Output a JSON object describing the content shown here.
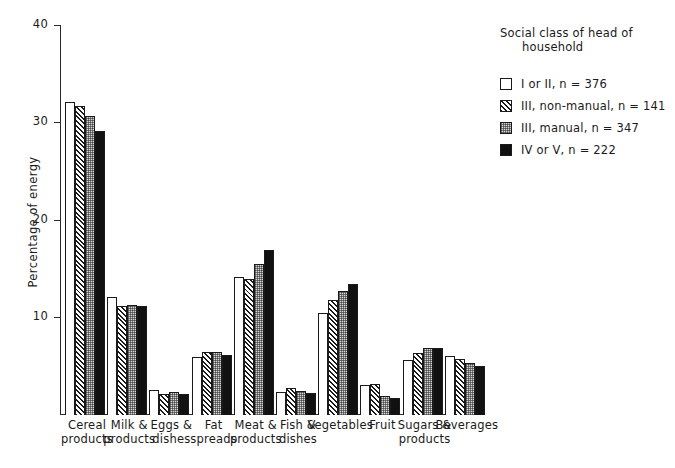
{
  "chart_data": {
    "type": "bar",
    "title": "",
    "xlabel": "",
    "ylabel": "Percentage of energy",
    "ylim": [
      0,
      40
    ],
    "yticks": [
      0,
      10,
      20,
      30,
      40
    ],
    "ytick_labels": [
      "",
      "10",
      "20",
      "30",
      "40"
    ],
    "grid": false,
    "legend_position": "top-right",
    "legend_title": "Social class of head of household",
    "legend_title_line1": "Social class of head of",
    "legend_title_line2": "household",
    "categories": [
      "Cereal\nproducts",
      "Milk &\nproducts",
      "Eggs &\ndishes",
      "Fat\nspreads",
      "Meat &\nproducts",
      "Fish &\ndishes",
      "Vegetables",
      "Fruit",
      "Sugars &\nproducts",
      "Beverages"
    ],
    "series": [
      {
        "name": "I or II, n = 376",
        "pattern": "open",
        "values": [
          32.2,
          12.1,
          2.6,
          6.0,
          14.2,
          2.4,
          10.5,
          3.1,
          5.7,
          6.1
        ]
      },
      {
        "name": "III, non-manual, n = 141",
        "pattern": "diagonal-hatch",
        "values": [
          31.8,
          11.2,
          2.2,
          6.5,
          14.0,
          2.8,
          11.8,
          3.2,
          6.4,
          5.8
        ]
      },
      {
        "name": "III, manual, n = 347",
        "pattern": "dotted",
        "values": [
          30.7,
          11.3,
          2.4,
          6.5,
          15.5,
          2.5,
          12.8,
          2.0,
          6.9,
          5.4
        ]
      },
      {
        "name": "IV or V, n = 222",
        "pattern": "solid-black",
        "values": [
          29.2,
          11.2,
          2.2,
          6.2,
          17.0,
          2.3,
          13.5,
          1.7,
          6.9,
          5.0
        ]
      }
    ]
  },
  "colors": {
    "axis": "#2a2a2a",
    "text": "#1a1a1a",
    "background": "#ffffff",
    "series_solid": "#111111",
    "series_dots": "#d6d6d6",
    "series_open": "#ffffff"
  }
}
